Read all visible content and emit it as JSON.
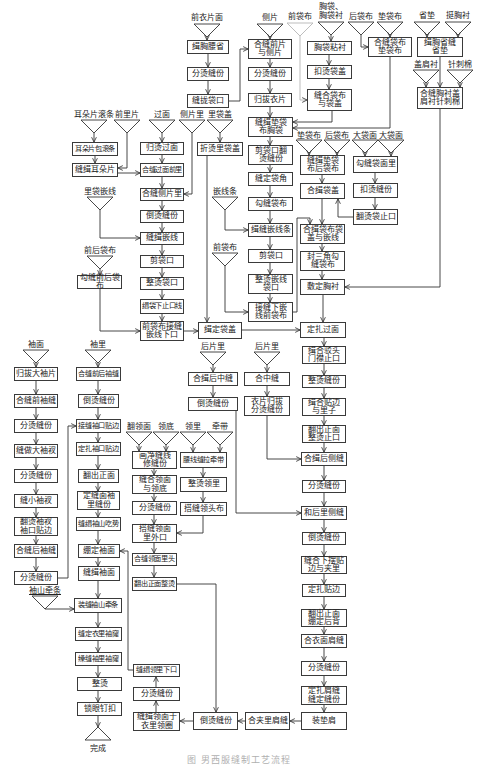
{
  "figure": {
    "caption": "图  男西服缝制工艺流程"
  },
  "inputs": [
    {
      "label": "前衣片面"
    },
    {
      "label": "侧片"
    },
    {
      "label": "前袋布"
    },
    {
      "label": "胸袋、胸袋衬"
    },
    {
      "label": "后袋布"
    },
    {
      "label": "垫袋布"
    },
    {
      "label": "省垫"
    },
    {
      "label": "挺胸衬"
    },
    {
      "label": "盖肩衬"
    },
    {
      "label": "针刺棉"
    },
    {
      "label": "耳朵片滚条"
    },
    {
      "label": "前里片"
    },
    {
      "label": "过面"
    },
    {
      "label": "侧片里"
    },
    {
      "label": "里袋盖"
    },
    {
      "label": "垫袋布"
    },
    {
      "label": "后袋布"
    },
    {
      "label": "大袋面"
    },
    {
      "label": "大袋面"
    },
    {
      "label": "里袋嵌线"
    },
    {
      "label": "嵌线条"
    },
    {
      "label": "前后袋布"
    },
    {
      "label": "前袋布"
    },
    {
      "label": "袖面"
    },
    {
      "label": "袖里"
    },
    {
      "label": "后片里"
    },
    {
      "label": "后片里"
    },
    {
      "label": "翻领面"
    },
    {
      "label": "领底"
    },
    {
      "label": "领里"
    },
    {
      "label": "牵带"
    },
    {
      "label": "袖山牵条"
    }
  ],
  "steps": [
    {
      "label": "缉胸腰省"
    },
    {
      "label": "分烫缝份"
    },
    {
      "label": "缝拢袋口"
    },
    {
      "label": "合缝前片与侧片"
    },
    {
      "label": "分烫缝份"
    },
    {
      "label": "归拔衣片"
    },
    {
      "label": "缝缉垫袋布胸袋"
    },
    {
      "label": "剪袋口翻烫缝份"
    },
    {
      "label": "缝定袋角"
    },
    {
      "label": "勾缝袋布"
    },
    {
      "label": "缉缝嵌线条"
    },
    {
      "label": "剪袋口"
    },
    {
      "label": "整烫嵌线袋口"
    },
    {
      "label": "接缝下嵌线前袋布"
    },
    {
      "label": "胸袋粘衬"
    },
    {
      "label": "扣烫袋盖"
    },
    {
      "label": "缝合袋布与袋盖"
    },
    {
      "label": "合缝袋布垫袋布"
    },
    {
      "label": "缉胸省缝省垫"
    },
    {
      "label": "合缝胸衬盖肩衬针刺棉"
    },
    {
      "label": "缝缉垫袋布后袋布"
    },
    {
      "label": "合缉袋盖"
    },
    {
      "label": "合缉袋布袋盖与嵌线"
    },
    {
      "label": "封三角勾缝袋布"
    },
    {
      "label": "敷定胸衬"
    },
    {
      "label": "勾缝袋面里"
    },
    {
      "label": "扣烫缝份"
    },
    {
      "label": "翻烫袋止口"
    },
    {
      "label": "耳朵片包滚条"
    },
    {
      "label": "缝缉耳朵片"
    },
    {
      "label": "勾缝前后袋布"
    },
    {
      "label": "归烫过面"
    },
    {
      "label": "合缝过面前里"
    },
    {
      "label": "合缝侧片里"
    },
    {
      "label": "倒烫缝份"
    },
    {
      "label": "缝缉嵌线"
    },
    {
      "label": "剪袋口"
    },
    {
      "label": "整烫袋口"
    },
    {
      "label": "缉袋下止口线"
    },
    {
      "label": "前袋布接缝嵌线下口"
    },
    {
      "label": "折烫里袋盖"
    },
    {
      "label": "缉定袋盖"
    },
    {
      "label": "定扎过面"
    },
    {
      "label": "缉合驳头门襟止口"
    },
    {
      "label": "整烫缝份"
    },
    {
      "label": "缉合贴边与里子"
    },
    {
      "label": "翻出正面整烫止口"
    },
    {
      "label": "合缉后侧缝"
    },
    {
      "label": "分烫缝份"
    },
    {
      "label": "和后里侧缝"
    },
    {
      "label": "倒烫缝份"
    },
    {
      "label": "缝合下摆贴边与夹里"
    },
    {
      "label": "定扎贴边"
    },
    {
      "label": "翻出正面绷定后背"
    },
    {
      "label": "合衣面肩缝"
    },
    {
      "label": "分烫缝份"
    },
    {
      "label": "定扎肩缝缝定缝份"
    },
    {
      "label": "装垫肩"
    },
    {
      "label": "合夹里肩缝"
    },
    {
      "label": "倒烫缝份"
    },
    {
      "label": "合缉后中缝"
    },
    {
      "label": "倒烫缝份"
    },
    {
      "label": "合中缝"
    },
    {
      "label": "衣片归拔分烫缝份"
    },
    {
      "label": "画净缝线修缝份"
    },
    {
      "label": "缝合领面与领底"
    },
    {
      "label": "分烫缝份"
    },
    {
      "label": "搭缝领面里外口"
    },
    {
      "label": "合缝领面里头"
    },
    {
      "label": "翻出正面整烫"
    },
    {
      "label": "腰线缝拉牵带"
    },
    {
      "label": "整烫领里"
    },
    {
      "label": "搭缝领头布"
    },
    {
      "label": "缝缉领里下口"
    },
    {
      "label": "分烫缝份"
    },
    {
      "label": "缝缉领面于衣里领圈"
    },
    {
      "label": "归拔大袖片"
    },
    {
      "label": "合缝前袖缝"
    },
    {
      "label": "分烫缝份"
    },
    {
      "label": "缝做大袖衩"
    },
    {
      "label": "分烫缝份"
    },
    {
      "label": "缝小袖衩"
    },
    {
      "label": "翻烫袖衩袖口贴边"
    },
    {
      "label": "合缝后袖缝"
    },
    {
      "label": "分烫缝份"
    },
    {
      "label": "合缝前后袖缝"
    },
    {
      "label": "倒烫缝份"
    },
    {
      "label": "接缝袖口贴边"
    },
    {
      "label": "定扎袖口贴边"
    },
    {
      "label": "翻出正面"
    },
    {
      "label": "定缝面袖里缝份"
    },
    {
      "label": "缝缉袖山吃势"
    },
    {
      "label": "绷定袖面"
    },
    {
      "label": "缝缉袖面"
    },
    {
      "label": "装缝袖山牵条"
    },
    {
      "label": "缝定衣里袖窿"
    },
    {
      "label": "缲缝袖里袖窿"
    },
    {
      "label": "整烫"
    },
    {
      "label": "锁眼钉扣"
    }
  ],
  "end": {
    "label": "完成"
  },
  "colors": {
    "line": "#333333",
    "box_border": "#3a3a3a",
    "background": "#ffffff"
  }
}
